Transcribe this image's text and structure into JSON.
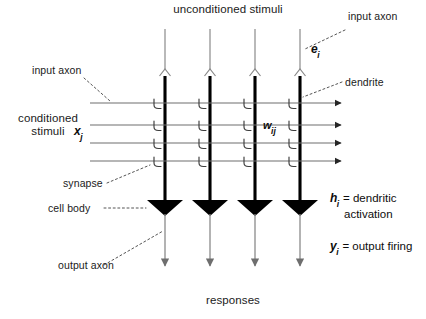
{
  "diagram": {
    "title_top": "unconditioned stimuli",
    "title_bottom": "responses",
    "left_group_line1": "conditioned",
    "left_group_line2": "stimuli",
    "labels": {
      "input_axon_top": "input axon",
      "input_axon_left": "input axon",
      "dendrite": "dendrite",
      "synapse": "synapse",
      "cell_body": "cell body",
      "output_axon": "output axon"
    },
    "math": {
      "e_var": "e",
      "e_sub": "i",
      "x_var": "x",
      "x_sub": "j",
      "w_var": "w",
      "w_sub": "ij",
      "h_var": "h",
      "h_sub": "i",
      "h_desc_line1": "= dendritic",
      "h_desc_line2": "activation",
      "y_var": "y",
      "y_sub": "i",
      "y_desc": "= output firing"
    },
    "colors": {
      "ink": "#1a1a1a",
      "trunk": "#000000",
      "axon": "#808080",
      "dendrite_line": "#6e6e6e",
      "leader": "#555555",
      "background": "#ffffff"
    },
    "geometry": {
      "columns_x": [
        165,
        210,
        255,
        300
      ],
      "dendrite_rows_y": [
        103,
        125,
        143,
        161
      ],
      "dendrite_start_x": 90,
      "dendrite_end_x": 347,
      "trunk_top_y": 75,
      "trunk_bottom_y": 202,
      "soma_y": 215,
      "axon_out_end_y": 272,
      "axon_in_top_y": 29,
      "fork_y": 70
    }
  }
}
